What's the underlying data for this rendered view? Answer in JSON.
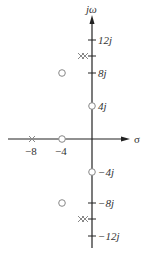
{
  "diagram": {
    "type": "pole-zero plot (s-plane)",
    "axes": {
      "vertical_label": "jω",
      "horizontal_label": "σ"
    },
    "imag_ticks": [
      {
        "value": 12,
        "label": "12j"
      },
      {
        "value": 8,
        "label": "8j"
      },
      {
        "value": 4,
        "label": "4j"
      },
      {
        "value": -4,
        "label": "−4j"
      },
      {
        "value": -8,
        "label": "−8j"
      },
      {
        "value": -12,
        "label": "−12j"
      }
    ],
    "real_ticks": [
      {
        "value": -8,
        "label": "−8"
      },
      {
        "value": -4,
        "label": "−4"
      }
    ],
    "poles": [
      {
        "re": -8,
        "im": 0,
        "multiplicity": 1
      },
      {
        "re": -1,
        "im": 10,
        "multiplicity": 2
      },
      {
        "re": -1,
        "im": -10,
        "multiplicity": 2
      }
    ],
    "zeros": [
      {
        "re": -4,
        "im": 0
      },
      {
        "re": 0,
        "im": 4
      },
      {
        "re": 0,
        "im": -4
      },
      {
        "re": -4,
        "im": 8
      },
      {
        "re": -4,
        "im": -8
      }
    ],
    "colors": {
      "axis": "#222222",
      "marker": "#888888",
      "text": "#333333"
    }
  }
}
